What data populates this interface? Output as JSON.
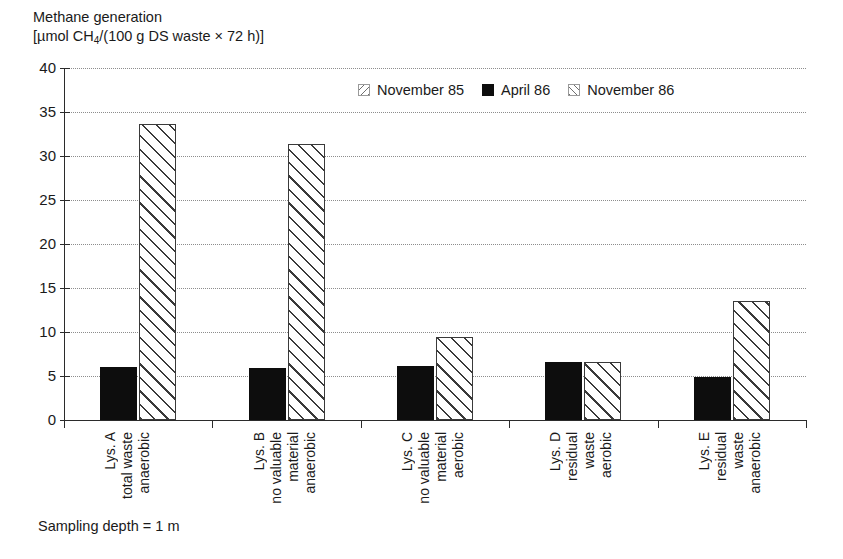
{
  "axis_title": {
    "line1": "Methane generation",
    "line2_pre": "[µmol CH",
    "line2_sub": "4",
    "line2_post": "/(100 g DS waste × 72 h)]"
  },
  "footnote": "Sampling depth = 1 m",
  "legend": {
    "items": [
      {
        "label": "November 85",
        "swatch": "hatch-backslash-icon",
        "color": "#ffffff"
      },
      {
        "label": "April 86",
        "swatch": "solid-black-icon",
        "color": "#0d0d0d"
      },
      {
        "label": "November 86",
        "swatch": "hatch-slash-icon",
        "color": "#ffffff"
      }
    ]
  },
  "y_axis": {
    "ticks": [
      "0",
      "5",
      "10",
      "15",
      "20",
      "25",
      "30",
      "35",
      "40"
    ],
    "min": 0,
    "max": 40,
    "step": 5
  },
  "categories": [
    {
      "id": "lys-a",
      "lines": [
        "Lys. A",
        "total waste",
        "anaerobic"
      ]
    },
    {
      "id": "lys-b",
      "lines": [
        "Lys. B",
        "no valuable",
        "material",
        "anaerobic"
      ]
    },
    {
      "id": "lys-c",
      "lines": [
        "Lys. C",
        "no valuable",
        "material",
        "aerobic"
      ]
    },
    {
      "id": "lys-d",
      "lines": [
        "Lys. D",
        "residual",
        "waste",
        "aerobic"
      ]
    },
    {
      "id": "lys-e",
      "lines": [
        "Lys. E",
        "residual",
        "waste",
        "anaerobic"
      ]
    }
  ],
  "chart_data": {
    "type": "bar",
    "title": "Methane generation [µmol CH4/(100 g DS waste × 72 h)]",
    "xlabel": "",
    "ylabel": "Methane generation [µmol CH4/(100 g DS waste × 72 h)]",
    "ylim": [
      0,
      40
    ],
    "ytick_step": 5,
    "grid": true,
    "legend_position": "top-center",
    "categories": [
      "Lys. A total waste anaerobic",
      "Lys. B no valuable material anaerobic",
      "Lys. C no valuable material aerobic",
      "Lys. D residual waste aerobic",
      "Lys. E residual waste anaerobic"
    ],
    "series": [
      {
        "name": "November 85",
        "values": [
          0,
          0,
          0,
          0,
          0
        ],
        "note": "no bars plotted"
      },
      {
        "name": "April 86",
        "values": [
          6.0,
          5.9,
          6.1,
          6.6,
          4.85
        ]
      },
      {
        "name": "November 86",
        "values": [
          33.6,
          31.4,
          9.45,
          6.55,
          13.5
        ]
      }
    ]
  }
}
